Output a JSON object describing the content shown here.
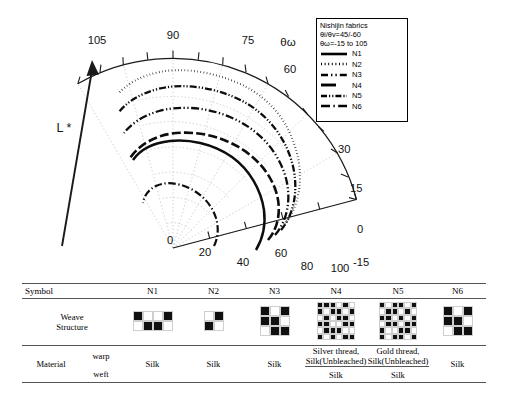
{
  "legend": {
    "title": "Nishijin fabrics",
    "cond1": "θi/θv=45/-60",
    "cond2": "θω=-15 to 105",
    "entries": [
      {
        "label": "N1",
        "style": "solid"
      },
      {
        "label": "N2",
        "style": "dotted"
      },
      {
        "label": "N3",
        "style": "dash-dot-dot"
      },
      {
        "label": "N4",
        "style": "dashed"
      },
      {
        "label": "N5",
        "style": "dash-dot-dense"
      },
      {
        "label": "N6",
        "style": "dash-dot"
      }
    ]
  },
  "axes": {
    "angular_label": "θω",
    "radial_label": "L *",
    "angular_ticks": [
      "105",
      "90",
      "75",
      "60",
      "45",
      "30",
      "15",
      "0",
      "-15"
    ],
    "radial_ticks": [
      "0",
      "20",
      "40",
      "60",
      "80",
      "100"
    ]
  },
  "chart_data": {
    "type": "line",
    "title": "Nishijin fabrics",
    "projection": "polar",
    "xlabel": "θω",
    "ylabel": "L *",
    "xlim": [
      -15,
      105
    ],
    "ylim": [
      0,
      100
    ],
    "grid": true,
    "legend_position": "top-right",
    "x": [
      -15,
      0,
      15,
      30,
      45,
      60,
      75,
      90,
      105
    ],
    "series": [
      {
        "name": "N1",
        "style": "solid",
        "values": [
          44,
          46,
          50,
          55,
          62,
          68,
          71,
          72,
          70
        ]
      },
      {
        "name": "N2",
        "style": "dotted",
        "values": [
          62,
          66,
          72,
          78,
          84,
          88,
          91,
          92,
          90
        ]
      },
      {
        "name": "N3",
        "style": "dash-dot-dot",
        "values": [
          52,
          56,
          62,
          70,
          76,
          80,
          82,
          82,
          80
        ]
      },
      {
        "name": "N4",
        "style": "dashed",
        "values": [
          46,
          49,
          54,
          60,
          66,
          70,
          72,
          72,
          70
        ]
      },
      {
        "name": "N5",
        "style": "dash-dot-dense",
        "values": [
          58,
          62,
          68,
          74,
          80,
          84,
          86,
          86,
          84
        ]
      },
      {
        "name": "N6",
        "style": "dash-dot",
        "values": [
          26,
          27,
          29,
          31,
          33,
          34,
          34,
          33,
          31
        ]
      }
    ]
  },
  "table": {
    "header": {
      "label": "Symbol",
      "columns": [
        "N1",
        "N2",
        "N3",
        "N4",
        "N5",
        "N6"
      ]
    },
    "weave": {
      "label_line1": "Weave",
      "label_line2": "Structure",
      "patterns": [
        {
          "name": "N1",
          "cols": 4,
          "rows": 2,
          "cells": [
            1,
            0,
            0,
            1,
            0,
            1,
            1,
            0
          ]
        },
        {
          "name": "N2",
          "cols": 2,
          "rows": 2,
          "cells": [
            0,
            1,
            1,
            0
          ]
        },
        {
          "name": "N3",
          "cols": 3,
          "rows": 3,
          "cells": [
            1,
            0,
            1,
            1,
            1,
            0,
            0,
            1,
            1
          ]
        },
        {
          "name": "N4",
          "cols": 6,
          "rows": 6,
          "cells": [
            1,
            1,
            1,
            0,
            1,
            0,
            1,
            0,
            1,
            1,
            0,
            1,
            0,
            1,
            0,
            1,
            1,
            0,
            1,
            1,
            0,
            0,
            1,
            1,
            0,
            1,
            1,
            1,
            0,
            0,
            1,
            0,
            1,
            0,
            1,
            1
          ]
        },
        {
          "name": "N5",
          "cols": 6,
          "rows": 6,
          "cells": [
            1,
            0,
            1,
            1,
            0,
            1,
            0,
            1,
            1,
            0,
            1,
            0,
            1,
            1,
            0,
            1,
            0,
            1,
            0,
            1,
            1,
            0,
            1,
            1,
            1,
            0,
            0,
            1,
            1,
            0,
            1,
            0,
            1,
            1,
            0,
            1
          ]
        },
        {
          "name": "N6",
          "cols": 3,
          "rows": 3,
          "cells": [
            1,
            0,
            1,
            1,
            1,
            0,
            0,
            1,
            1
          ]
        }
      ]
    },
    "material": {
      "label": "Material",
      "warp_label": "warp",
      "weft_label": "weft",
      "warp": [
        "Silk",
        "Silk",
        "Silk",
        "Silver thread,\nSilk(Unbleached)",
        "Gold thread,\nSilk(Unbleached)",
        "Silk"
      ],
      "weft": [
        "",
        "",
        "",
        "Silk",
        "Silk",
        ""
      ]
    }
  }
}
